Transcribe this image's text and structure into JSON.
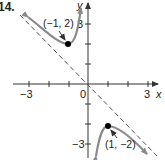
{
  "problem_number": "14.",
  "axes": {
    "x_label": "x",
    "y_label": "y",
    "x_ticks": {
      "neg": "-3",
      "origin": "0",
      "pos": "3"
    },
    "y_ticks": {
      "pos": "3",
      "neg": "-3"
    },
    "range": [
      -3.5,
      3.5
    ]
  },
  "points": [
    {
      "label": "(−1, 2)",
      "x": -1,
      "y": 2
    },
    {
      "label": "(1, −2)",
      "x": 1,
      "y": -2
    }
  ],
  "asymptote": {
    "equation": "y = -x",
    "style": "dashed"
  },
  "colors": {
    "curve": "#8a8a8a",
    "axis": "#333333",
    "dashed": "#555555",
    "point": "#000000"
  }
}
